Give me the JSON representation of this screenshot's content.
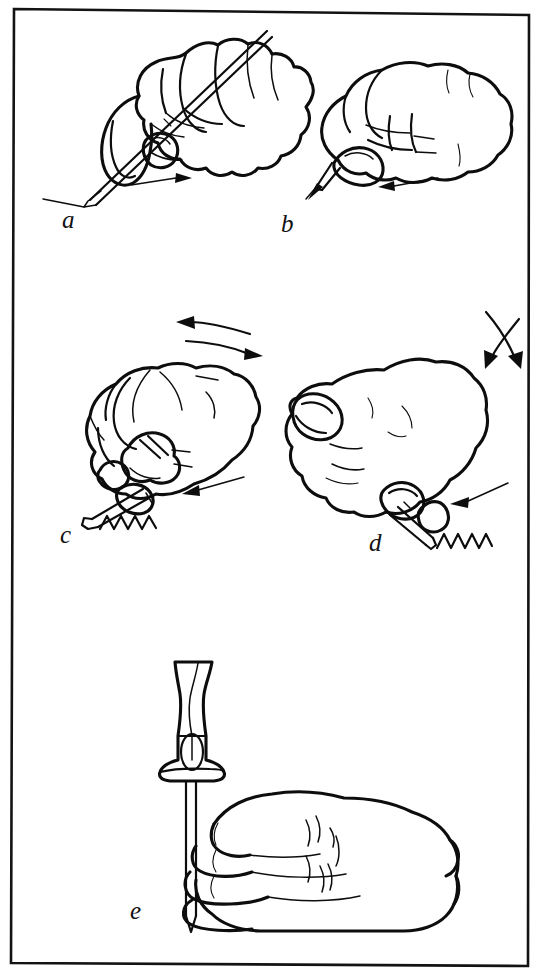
{
  "plate": {
    "kind": "technical-line-illustration",
    "subject": "Methods of holding a scriber / scratch awl",
    "background_color": "#ffffff",
    "ink_color": "#0d0d0d",
    "frame_color": "#131313",
    "width": 552,
    "height": 979
  },
  "panels": [
    {
      "id": "a",
      "label": "a",
      "label_x": 62,
      "label_y": 228,
      "caption": "Hand gripping scriber like a pencil, held at a shallow angle, drawing a straight line",
      "tool": "scriber-pencil-grip",
      "arrows": [
        {
          "name": "straight-arrow-right",
          "direction": "right",
          "style": "straight"
        }
      ]
    },
    {
      "id": "b",
      "label": "b",
      "label_x": 281,
      "label_y": 232,
      "caption": "Closed fist grip with scriber point projecting from the little-finger side, drawing toward the left",
      "tool": "scriber-fist-grip",
      "arrows": [
        {
          "name": "straight-arrow-left",
          "direction": "left",
          "style": "straight"
        }
      ]
    },
    {
      "id": "c",
      "label": "c",
      "label_x": 60,
      "label_y": 543,
      "caption": "Fist grip with wrist rocking back and forth, scriber cutting a zig-zag scratch mark",
      "tool": "scriber-rocking-grip",
      "marks": "zigzag-scratch",
      "arrows": [
        {
          "name": "curved-arrow-left",
          "direction": "left",
          "style": "curved"
        },
        {
          "name": "curved-arrow-right",
          "direction": "right",
          "style": "curved"
        },
        {
          "name": "straight-arrow-left",
          "direction": "left",
          "style": "straight"
        }
      ]
    },
    {
      "id": "d",
      "label": "d",
      "label_x": 369,
      "label_y": 551,
      "caption": "Thumb-and-finger grip with the hand rotated, oscillating scriber producing a zig-zag scratch",
      "tool": "scriber-thumb-grip",
      "marks": "zigzag-scratch",
      "arrows": [
        {
          "name": "curved-arrow-up",
          "direction": "up",
          "style": "curved"
        },
        {
          "name": "curved-arrow-down",
          "direction": "down",
          "style": "curved"
        },
        {
          "name": "straight-arrow-left",
          "direction": "left",
          "style": "straight"
        }
      ]
    },
    {
      "id": "e",
      "label": "e",
      "label_x": 130,
      "label_y": 919,
      "caption": "Scriber with turned wooden handle held vertically, point downward, hand wrapped around the shank",
      "tool": "scriber-with-turned-handle",
      "arrows": []
    }
  ]
}
